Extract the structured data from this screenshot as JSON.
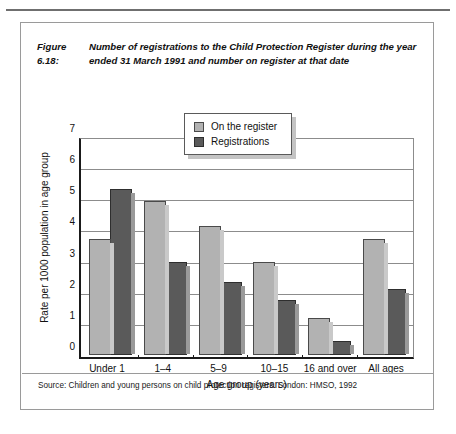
{
  "page": {
    "number": ""
  },
  "figure": {
    "label": "Figure 6.18:",
    "title": "Number of registrations to the Child Protection Register during the year ended 31 March 1991 and number on register at that date",
    "source": "Source: Children and young persons on child protection registers. London: HMSO, 1992"
  },
  "colors": {
    "series_on_register": "#b2b2b2",
    "series_registrations": "#5a5a5a",
    "axis": "#1a1a1a",
    "gridline": "#8c8c8c",
    "frame": "#9a9a9a"
  },
  "chart_data": {
    "type": "bar",
    "title": "Number of registrations to the Child Protection Register during the year ended 31 March 1991 and number on register at that date",
    "xlabel": "Age group (years)",
    "ylabel": "Rate per 1000 population in age group",
    "categories": [
      "Under 1",
      "1–4",
      "5–9",
      "10–15",
      "16 and over",
      "All ages"
    ],
    "series": [
      {
        "name": "On the register",
        "values": [
          4.2,
          5.55,
          4.65,
          3.35,
          1.35,
          4.2
        ]
      },
      {
        "name": "Registrations",
        "values": [
          6.0,
          3.35,
          2.65,
          2.0,
          0.5,
          2.4
        ]
      }
    ],
    "ylim": [
      0,
      7
    ],
    "yticks": [
      0,
      1,
      2,
      3,
      4,
      5,
      6,
      7
    ],
    "ytick_labels": [
      "0",
      "1",
      "2",
      "3",
      "4",
      "5",
      "6",
      "7"
    ],
    "grid": true,
    "legend_position": "top-center"
  }
}
